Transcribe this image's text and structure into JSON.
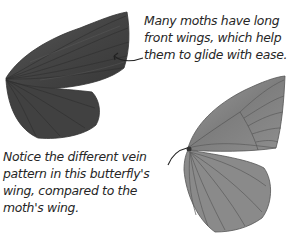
{
  "captions": {
    "moth": {
      "lines": [
        "Many moths have long",
        "front wings, which help",
        "them to glide with ease."
      ]
    },
    "butterfly": {
      "lines": [
        "Notice the different vein",
        "pattern in this butterfly's",
        "wing, compared to the",
        "moth's wing."
      ]
    }
  },
  "illustrations": {
    "moth_wing": {
      "label": "moth-wing",
      "color": "#4a4a4a"
    },
    "butterfly_wing": {
      "label": "butterfly-wing",
      "color": "#8a8a8a"
    }
  }
}
